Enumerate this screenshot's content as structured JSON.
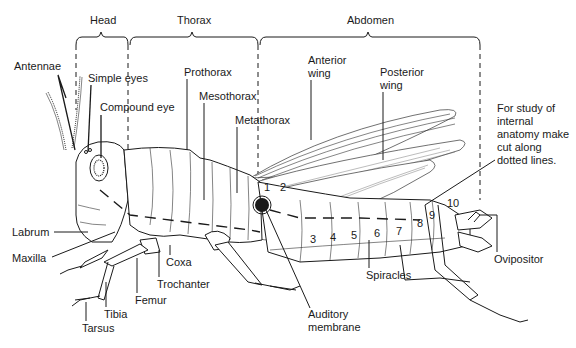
{
  "diagram": {
    "regions": [
      {
        "label": "Head",
        "x": 77,
        "y": 22
      },
      {
        "label": "Thorax",
        "x": 190,
        "y": 22
      },
      {
        "label": "Abdomen",
        "x": 370,
        "y": 22
      }
    ],
    "labels": {
      "antennae": "Antennae",
      "simple_eyes": "Simple eyes",
      "compound_eye": "Compound eye",
      "prothorax": "Prothorax",
      "mesothorax": "Mesothorax",
      "metathorax": "Metathorax",
      "anterior_wing_1": "Anterior",
      "anterior_wing_2": "wing",
      "posterior_wing_1": "Posterior",
      "posterior_wing_2": "wing",
      "note_1": "For study of",
      "note_2": "internal",
      "note_3": "anatomy make",
      "note_4": "cut along",
      "note_5": "dotted lines.",
      "labrum": "Labrum",
      "maxilla": "Maxilla",
      "coxa": "Coxa",
      "trochanter": "Trochanter",
      "femur": "Femur",
      "tibia": "Tibia",
      "tarsus": "Tarsus",
      "auditory_1": "Auditory",
      "auditory_2": "membrane",
      "spiracles": "Spiracles",
      "ovipositor": "Ovipositor"
    },
    "segment_numbers": [
      "1",
      "2",
      "3",
      "4",
      "5",
      "6",
      "7",
      "8",
      "9",
      "10"
    ]
  }
}
